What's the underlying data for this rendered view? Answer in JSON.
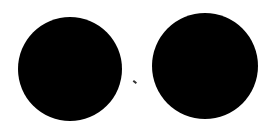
{
  "canvas": {
    "width": 274,
    "height": 131,
    "background": "#ffffff"
  },
  "shapes": [
    {
      "name": "left-circle",
      "type": "circle",
      "cx": 70,
      "cy": 69,
      "r": 52,
      "color": "#000000"
    },
    {
      "name": "right-circle",
      "type": "circle",
      "cx": 205,
      "cy": 66,
      "r": 53,
      "color": "#000000"
    }
  ],
  "marks": [
    {
      "name": "speck",
      "x": 133,
      "y": 81,
      "color": "#333333"
    }
  ]
}
